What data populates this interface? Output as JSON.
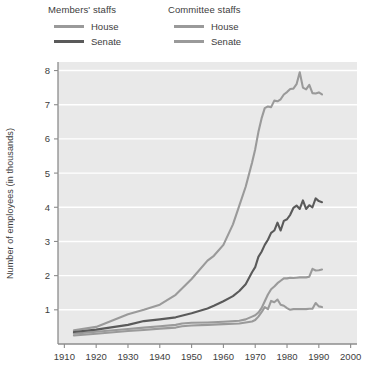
{
  "legend": {
    "groups": [
      {
        "title": "Members' staffs",
        "entries": [
          {
            "label": "House",
            "color": "#9a9a9a"
          },
          {
            "label": "Senate",
            "color": "#5a5a5a"
          }
        ]
      },
      {
        "title": "Committee staffs",
        "entries": [
          {
            "label": "House",
            "color": "#9a9a9a"
          },
          {
            "label": "Senate",
            "color": "#9a9a9a"
          }
        ]
      }
    ]
  },
  "chart_data": {
    "type": "line",
    "title": "",
    "xlabel": "",
    "ylabel": "Number of employees (in thousands)",
    "xlim": [
      1908,
      2002
    ],
    "ylim": [
      0,
      8.25
    ],
    "xticks": [
      1910,
      1920,
      1930,
      1940,
      1950,
      1960,
      1970,
      1980,
      1990,
      2000
    ],
    "yticks": [
      1,
      2,
      3,
      4,
      5,
      6,
      7,
      8
    ],
    "grid": "horizontal",
    "legend_position": "above-plot",
    "plot_background": "#e9e9e9",
    "gridline_color": "#ffffff",
    "series": [
      {
        "name": "Members' staffs — House",
        "color": "#9a9a9a",
        "width": 2.1,
        "points": [
          [
            1913,
            0.4
          ],
          [
            1920,
            0.5
          ],
          [
            1930,
            0.87
          ],
          [
            1935,
            1.0
          ],
          [
            1940,
            1.15
          ],
          [
            1945,
            1.44
          ],
          [
            1950,
            1.9
          ],
          [
            1955,
            2.44
          ],
          [
            1957,
            2.58
          ],
          [
            1960,
            2.9
          ],
          [
            1963,
            3.5
          ],
          [
            1965,
            4.05
          ],
          [
            1967,
            4.6
          ],
          [
            1969,
            5.3
          ],
          [
            1970,
            5.7
          ],
          [
            1971,
            6.2
          ],
          [
            1972,
            6.6
          ],
          [
            1973,
            6.9
          ],
          [
            1974,
            6.95
          ],
          [
            1975,
            6.93
          ],
          [
            1976,
            7.12
          ],
          [
            1977,
            7.1
          ],
          [
            1978,
            7.16
          ],
          [
            1979,
            7.3
          ],
          [
            1980,
            7.37
          ],
          [
            1981,
            7.46
          ],
          [
            1982,
            7.47
          ],
          [
            1983,
            7.6
          ],
          [
            1984,
            7.95
          ],
          [
            1985,
            7.5
          ],
          [
            1986,
            7.45
          ],
          [
            1987,
            7.58
          ],
          [
            1988,
            7.34
          ],
          [
            1989,
            7.33
          ],
          [
            1990,
            7.36
          ],
          [
            1991,
            7.3
          ]
        ]
      },
      {
        "name": "Members' staffs — Senate",
        "color": "#5a5a5a",
        "width": 2.1,
        "points": [
          [
            1913,
            0.35
          ],
          [
            1920,
            0.42
          ],
          [
            1930,
            0.56
          ],
          [
            1935,
            0.67
          ],
          [
            1940,
            0.72
          ],
          [
            1945,
            0.78
          ],
          [
            1950,
            0.9
          ],
          [
            1955,
            1.04
          ],
          [
            1957,
            1.12
          ],
          [
            1960,
            1.25
          ],
          [
            1963,
            1.4
          ],
          [
            1965,
            1.55
          ],
          [
            1967,
            1.75
          ],
          [
            1969,
            2.1
          ],
          [
            1970,
            2.25
          ],
          [
            1971,
            2.55
          ],
          [
            1972,
            2.7
          ],
          [
            1973,
            2.9
          ],
          [
            1974,
            3.05
          ],
          [
            1975,
            3.25
          ],
          [
            1976,
            3.32
          ],
          [
            1977,
            3.55
          ],
          [
            1978,
            3.32
          ],
          [
            1979,
            3.6
          ],
          [
            1980,
            3.65
          ],
          [
            1981,
            3.78
          ],
          [
            1982,
            3.98
          ],
          [
            1983,
            4.05
          ],
          [
            1984,
            3.95
          ],
          [
            1985,
            4.2
          ],
          [
            1986,
            3.95
          ],
          [
            1987,
            4.06
          ],
          [
            1988,
            4.0
          ],
          [
            1989,
            4.26
          ],
          [
            1990,
            4.18
          ],
          [
            1991,
            4.15
          ]
        ]
      },
      {
        "name": "Committee staffs — House",
        "color": "#9a9a9a",
        "width": 2.1,
        "points": [
          [
            1913,
            0.3
          ],
          [
            1920,
            0.36
          ],
          [
            1930,
            0.44
          ],
          [
            1935,
            0.48
          ],
          [
            1940,
            0.52
          ],
          [
            1945,
            0.56
          ],
          [
            1947,
            0.6
          ],
          [
            1950,
            0.62
          ],
          [
            1955,
            0.63
          ],
          [
            1960,
            0.65
          ],
          [
            1965,
            0.68
          ],
          [
            1967,
            0.72
          ],
          [
            1969,
            0.8
          ],
          [
            1970,
            0.84
          ],
          [
            1971,
            0.92
          ],
          [
            1972,
            1.05
          ],
          [
            1973,
            1.25
          ],
          [
            1974,
            1.45
          ],
          [
            1975,
            1.6
          ],
          [
            1976,
            1.68
          ],
          [
            1977,
            1.78
          ],
          [
            1978,
            1.85
          ],
          [
            1979,
            1.92
          ],
          [
            1980,
            1.92
          ],
          [
            1981,
            1.94
          ],
          [
            1982,
            1.93
          ],
          [
            1983,
            1.94
          ],
          [
            1984,
            1.95
          ],
          [
            1985,
            1.95
          ],
          [
            1986,
            1.95
          ],
          [
            1987,
            1.97
          ],
          [
            1988,
            2.2
          ],
          [
            1989,
            2.15
          ],
          [
            1990,
            2.16
          ],
          [
            1991,
            2.18
          ]
        ]
      },
      {
        "name": "Committee staffs — Senate",
        "color": "#9a9a9a",
        "width": 2.1,
        "points": [
          [
            1913,
            0.25
          ],
          [
            1920,
            0.3
          ],
          [
            1930,
            0.38
          ],
          [
            1935,
            0.41
          ],
          [
            1940,
            0.45
          ],
          [
            1945,
            0.48
          ],
          [
            1947,
            0.52
          ],
          [
            1950,
            0.54
          ],
          [
            1955,
            0.56
          ],
          [
            1960,
            0.58
          ],
          [
            1965,
            0.6
          ],
          [
            1967,
            0.63
          ],
          [
            1969,
            0.66
          ],
          [
            1970,
            0.7
          ],
          [
            1971,
            0.8
          ],
          [
            1972,
            0.93
          ],
          [
            1973,
            1.08
          ],
          [
            1974,
            1.02
          ],
          [
            1975,
            1.26
          ],
          [
            1976,
            1.22
          ],
          [
            1977,
            1.3
          ],
          [
            1978,
            1.15
          ],
          [
            1979,
            1.12
          ],
          [
            1980,
            1.05
          ],
          [
            1981,
            1.0
          ],
          [
            1982,
            1.02
          ],
          [
            1983,
            1.02
          ],
          [
            1984,
            1.02
          ],
          [
            1985,
            1.02
          ],
          [
            1986,
            1.02
          ],
          [
            1987,
            1.03
          ],
          [
            1988,
            1.03
          ],
          [
            1989,
            1.2
          ],
          [
            1990,
            1.1
          ],
          [
            1991,
            1.08
          ]
        ]
      }
    ]
  }
}
